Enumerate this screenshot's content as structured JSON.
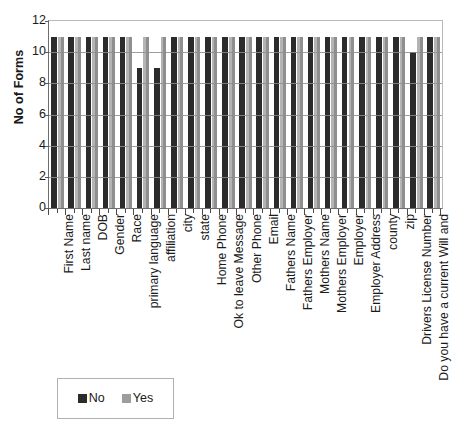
{
  "chart_data": {
    "type": "bar",
    "title": "",
    "subtitle": "",
    "xlabel": "",
    "ylabel": "No of Forms",
    "ylim": [
      0,
      12
    ],
    "yticks": [
      0,
      2,
      4,
      6,
      8,
      10,
      12
    ],
    "grid": true,
    "legend_position": "bottom-left",
    "orientation": "vertical",
    "bar_mode": "grouped",
    "categories": [
      "First Name",
      "Last name",
      "DOB",
      "Gender",
      "Race",
      "primary language",
      "affiliation",
      "city",
      "state",
      "Home Phone",
      "Ok to leave Message",
      "Other Phone",
      "Email",
      "Fathers Name",
      "Fathers Employer",
      "Mothers Name",
      "Mothers Employer",
      "Employer",
      "Employer Address",
      "county",
      "zip",
      "Drivers License Number",
      "Do you have a current Will and"
    ],
    "series": [
      {
        "name": "No",
        "color": "#2b2b2b",
        "values": [
          11,
          11,
          11,
          11,
          11,
          9,
          9,
          11,
          11,
          11,
          11,
          11,
          11,
          11,
          11,
          11,
          11,
          11,
          11,
          11,
          11,
          10,
          11
        ]
      },
      {
        "name": "Yes",
        "color": "#9d9d9d",
        "values": [
          11,
          11,
          11,
          11,
          11,
          11,
          11,
          11,
          11,
          11,
          11,
          11,
          11,
          11,
          11,
          11,
          11,
          11,
          11,
          11,
          11,
          11,
          11
        ]
      }
    ],
    "legend": [
      {
        "label": "No",
        "color": "#2b2b2b"
      },
      {
        "label": "Yes",
        "color": "#9d9d9d"
      }
    ]
  }
}
